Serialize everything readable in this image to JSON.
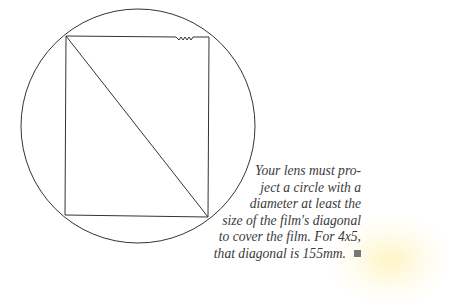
{
  "diagram": {
    "circle": {
      "label": "image circle"
    },
    "rectangle": {
      "label": "4x5 film"
    },
    "diagonal": {
      "label": "film diagonal"
    }
  },
  "caption": {
    "lines": [
      "Your lens must pro-",
      "ject a circle with a",
      "diameter at least the",
      "size of the film's diagonal",
      "to cover the film. For 4x5,",
      "that diagonal is 155mm."
    ],
    "end_mark": "■"
  },
  "colors": {
    "line": "#333333",
    "text": "#3a3a3a"
  }
}
